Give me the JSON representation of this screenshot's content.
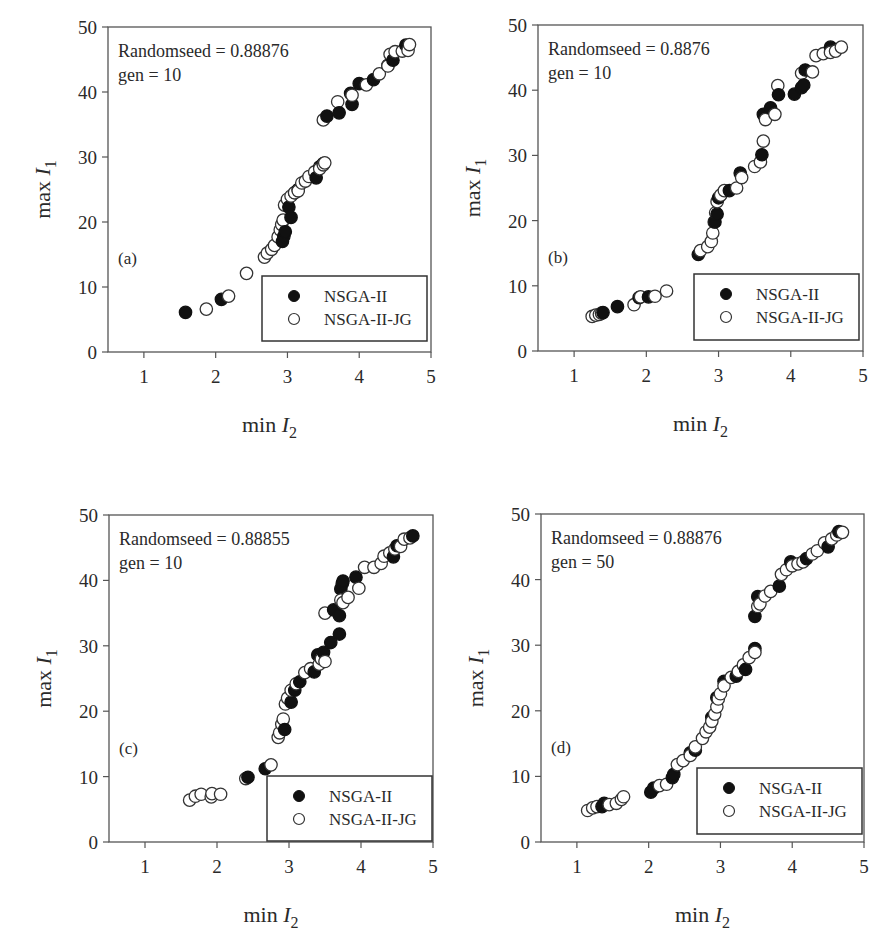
{
  "chart_data": [
    {
      "type": "scatter",
      "panel": "(a)",
      "annotation": [
        "Randomseed = 0.88876",
        "gen = 10"
      ],
      "xlabel": "min I2",
      "ylabel": "max I1",
      "xlim": [
        0.5,
        5
      ],
      "ylim": [
        0,
        50
      ],
      "xticks": [
        1,
        2,
        3,
        4,
        5
      ],
      "yticks": [
        0,
        10,
        20,
        30,
        40,
        50
      ],
      "grid": false,
      "legend": {
        "position": "lower right",
        "entries": [
          "NSGA-II",
          "NSGA-II-JG"
        ]
      },
      "series": [
        {
          "name": "NSGA-II",
          "marker": "filled-circle",
          "x": [
            1.58,
            2.08,
            2.93,
            2.95,
            2.97,
            3.05,
            3.02,
            3.1,
            3.15,
            3.4,
            3.45,
            3.5,
            3.55,
            3.72,
            3.9,
            3.88,
            4.0,
            4.2,
            4.4,
            4.47,
            4.65
          ],
          "y": [
            6.1,
            8.1,
            17.0,
            17.8,
            18.5,
            20.7,
            22.3,
            24.5,
            25.0,
            26.8,
            28.5,
            29.0,
            36.3,
            36.8,
            38.1,
            39.8,
            41.3,
            41.9,
            44.1,
            44.9,
            47.2
          ]
        },
        {
          "name": "NSGA-II-JG",
          "marker": "open-circle",
          "x": [
            1.87,
            2.18,
            2.43,
            2.68,
            2.72,
            2.78,
            2.82,
            2.87,
            2.9,
            2.92,
            2.94,
            2.96,
            3.0,
            3.05,
            3.1,
            3.15,
            3.2,
            3.25,
            3.3,
            3.38,
            3.45,
            3.5,
            3.52,
            3.5,
            3.7,
            3.9,
            4.1,
            4.28,
            4.4,
            4.43,
            4.5,
            4.6,
            4.68,
            4.7
          ],
          "y": [
            6.6,
            8.6,
            12.1,
            14.6,
            15.2,
            15.8,
            16.4,
            17.7,
            18.8,
            19.6,
            20.3,
            22.6,
            23.5,
            24.0,
            24.5,
            24.8,
            26.0,
            26.3,
            27.0,
            27.7,
            28.2,
            28.8,
            29.1,
            35.7,
            38.5,
            39.5,
            41.1,
            42.8,
            44.0,
            45.8,
            46.2,
            46.3,
            46.4,
            47.3
          ]
        }
      ]
    },
    {
      "type": "scatter",
      "panel": "(b)",
      "annotation": [
        "Randomseed = 0.8876",
        "gen = 10"
      ],
      "xlabel": "min I2",
      "ylabel": "max I1",
      "xlim": [
        0.5,
        5
      ],
      "ylim": [
        0,
        50
      ],
      "xticks": [
        1,
        2,
        3,
        4,
        5
      ],
      "yticks": [
        0,
        10,
        20,
        30,
        40,
        50
      ],
      "grid": false,
      "legend": {
        "position": "lower right",
        "entries": [
          "NSGA-II",
          "NSGA-II-JG"
        ]
      },
      "series": [
        {
          "name": "NSGA-II",
          "marker": "filled-circle",
          "x": [
            1.4,
            1.6,
            1.9,
            2.03,
            2.72,
            2.95,
            2.98,
            3.0,
            3.15,
            3.3,
            3.6,
            3.62,
            3.72,
            3.83,
            4.05,
            4.15,
            4.18,
            4.2,
            4.55
          ],
          "y": [
            5.9,
            6.8,
            8.2,
            8.3,
            14.8,
            19.8,
            21.0,
            23.5,
            24.6,
            27.3,
            30.1,
            36.3,
            37.3,
            39.3,
            39.4,
            40.4,
            40.8,
            43.1,
            46.6
          ]
        },
        {
          "name": "NSGA-II-JG",
          "marker": "open-circle",
          "x": [
            1.25,
            1.3,
            1.35,
            1.38,
            1.83,
            1.92,
            2.12,
            2.28,
            2.75,
            2.85,
            2.9,
            2.92,
            2.94,
            2.96,
            2.98,
            3.03,
            3.08,
            3.25,
            3.32,
            3.5,
            3.58,
            3.62,
            3.65,
            3.78,
            3.82,
            4.15,
            4.3,
            4.35,
            4.45,
            4.55,
            4.62,
            4.7
          ],
          "y": [
            5.3,
            5.5,
            5.6,
            5.8,
            7.1,
            8.3,
            8.4,
            9.2,
            15.4,
            16.0,
            16.8,
            18.1,
            19.8,
            21.2,
            22.9,
            23.9,
            24.6,
            25.0,
            26.6,
            28.3,
            29.0,
            32.2,
            35.5,
            36.3,
            40.7,
            42.6,
            42.8,
            45.3,
            45.6,
            45.8,
            46.0,
            46.6
          ]
        }
      ]
    },
    {
      "type": "scatter",
      "panel": "(c)",
      "annotation": [
        "Randomseed = 0.88855",
        "gen = 10"
      ],
      "xlabel": "min I2",
      "ylabel": "max I1",
      "xlim": [
        0.5,
        5
      ],
      "ylim": [
        0,
        50
      ],
      "xticks": [
        1,
        2,
        3,
        4,
        5
      ],
      "yticks": [
        0,
        10,
        20,
        30,
        40,
        50
      ],
      "grid": false,
      "legend": {
        "position": "lower right",
        "entries": [
          "NSGA-II",
          "NSGA-II-JG"
        ]
      },
      "series": [
        {
          "name": "NSGA-II",
          "marker": "filled-circle",
          "x": [
            2.43,
            2.67,
            2.94,
            3.03,
            3.08,
            3.15,
            3.35,
            3.4,
            3.48,
            3.58,
            3.62,
            3.7,
            3.7,
            3.72,
            3.74,
            3.75,
            3.93,
            4.45,
            4.5,
            4.72
          ],
          "y": [
            9.9,
            11.2,
            17.2,
            21.4,
            23.2,
            24.5,
            26.0,
            28.6,
            29.0,
            30.5,
            35.5,
            31.8,
            34.6,
            38.7,
            39.5,
            39.9,
            40.5,
            43.6,
            45.3,
            46.8
          ]
        },
        {
          "name": "NSGA-II-JG",
          "marker": "open-circle",
          "x": [
            1.62,
            1.7,
            1.78,
            1.92,
            1.93,
            2.05,
            2.4,
            2.75,
            2.85,
            2.87,
            2.9,
            2.92,
            2.95,
            2.98,
            3.03,
            3.1,
            3.22,
            3.3,
            3.42,
            3.45,
            3.5,
            3.5,
            3.72,
            3.75,
            3.82,
            3.97,
            4.05,
            4.18,
            4.28,
            4.32,
            4.4,
            4.47,
            4.55,
            4.6,
            4.68
          ],
          "y": [
            6.4,
            7.0,
            7.3,
            6.9,
            7.4,
            7.3,
            9.7,
            11.8,
            16.0,
            16.7,
            18.0,
            18.8,
            21.1,
            22.0,
            23.2,
            24.2,
            25.9,
            26.5,
            27.2,
            28.0,
            27.6,
            35.0,
            37.0,
            36.6,
            37.4,
            38.8,
            42.0,
            42.0,
            42.6,
            43.7,
            44.2,
            44.8,
            45.2,
            46.3,
            46.5
          ]
        }
      ]
    },
    {
      "type": "scatter",
      "panel": "(d)",
      "annotation": [
        "Randomseed = 0.88876",
        "gen = 50"
      ],
      "xlabel": "min I2",
      "ylabel": "max I1",
      "xlim": [
        0.5,
        5
      ],
      "ylim": [
        0,
        50
      ],
      "xticks": [
        1,
        2,
        3,
        4,
        5
      ],
      "yticks": [
        0,
        10,
        20,
        30,
        40,
        50
      ],
      "grid": false,
      "legend": {
        "position": "lower right",
        "entries": [
          "NSGA-II",
          "NSGA-II-JG"
        ]
      },
      "series": [
        {
          "name": "NSGA-II",
          "marker": "filled-circle",
          "x": [
            1.35,
            1.38,
            2.03,
            2.07,
            2.33,
            2.35,
            2.58,
            2.65,
            2.88,
            2.95,
            3.05,
            3.22,
            3.35,
            3.48,
            3.48,
            3.52,
            3.82,
            3.98,
            4.2,
            4.5,
            4.65
          ],
          "y": [
            5.4,
            5.9,
            7.6,
            8.2,
            9.8,
            10.3,
            13.6,
            14.0,
            19.0,
            22.0,
            24.5,
            25.3,
            26.3,
            29.5,
            34.4,
            37.4,
            39.0,
            42.7,
            43.2,
            45.0,
            47.3
          ]
        },
        {
          "name": "NSGA-II-JG",
          "marker": "open-circle",
          "x": [
            1.15,
            1.22,
            1.28,
            1.45,
            1.55,
            1.62,
            1.65,
            2.15,
            2.25,
            2.4,
            2.48,
            2.58,
            2.65,
            2.75,
            2.8,
            2.85,
            2.88,
            2.92,
            2.95,
            2.97,
            3.0,
            3.05,
            3.15,
            3.25,
            3.32,
            3.4,
            3.48,
            3.52,
            3.55,
            3.62,
            3.7,
            3.85,
            3.92,
            4.0,
            4.08,
            4.15,
            4.28,
            4.35,
            4.45,
            4.55,
            4.62,
            4.7
          ],
          "y": [
            4.8,
            5.2,
            5.4,
            5.7,
            5.9,
            6.5,
            6.9,
            8.6,
            8.8,
            11.8,
            12.4,
            13.2,
            14.5,
            15.8,
            16.8,
            17.5,
            18.4,
            19.5,
            20.6,
            21.8,
            22.6,
            23.8,
            25.1,
            26.0,
            27.0,
            28.1,
            28.9,
            35.9,
            36.3,
            37.5,
            38.2,
            40.8,
            41.5,
            42.1,
            42.4,
            42.7,
            43.9,
            44.4,
            45.6,
            46.2,
            46.8,
            47.2
          ]
        }
      ]
    }
  ],
  "labels": {
    "ylabel_text": "max ",
    "ylabel_var": "I",
    "ylabel_sub": "1",
    "xlabel_text": "min ",
    "xlabel_var": "I",
    "xlabel_sub": "2",
    "legend_nsga": "NSGA-II",
    "legend_jg": "NSGA-II-JG"
  }
}
